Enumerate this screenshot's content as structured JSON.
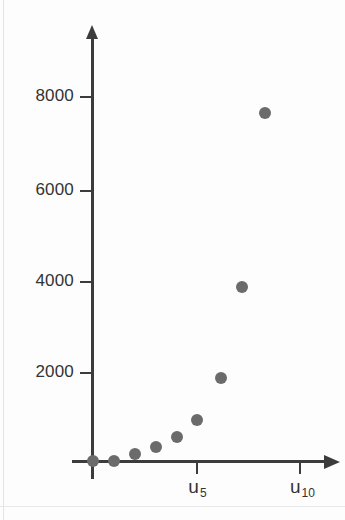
{
  "chart_data": {
    "type": "scatter",
    "title": "",
    "subtitle": "",
    "xlabel": "",
    "ylabel": "",
    "x_tick_labels": [
      "u5",
      "u10"
    ],
    "x_tick_label_html": [
      "u<sub>5</sub>",
      "u<sub>10</sub>"
    ],
    "x_tick_values": [
      5,
      10
    ],
    "y_tick_labels": [
      "8000",
      "6000",
      "4000",
      "2000"
    ],
    "y_tick_values": [
      8000,
      6000,
      4000,
      2000
    ],
    "xlim": [
      0,
      12
    ],
    "ylim": [
      0,
      9300
    ],
    "grid": false,
    "legend": null,
    "axes_style": "arrow-axes",
    "marker": "filled-circle",
    "marker_color": "#6b6b6b",
    "axis_color": "#3c3c3c",
    "x": [
      1,
      2,
      3,
      4,
      5,
      6,
      7,
      8,
      9,
      10
    ],
    "x_categories": [
      "u1",
      "u2",
      "u3",
      "u4",
      "u5",
      "u6",
      "u7",
      "u8",
      "u9",
      "u10"
    ],
    "values": [
      0,
      30,
      180,
      330,
      530,
      900,
      1820,
      3830,
      7620,
      null
    ],
    "series": [
      {
        "name": "series-1",
        "points": [
          {
            "label": "u1",
            "x": 1,
            "y": 0
          },
          {
            "label": "u2",
            "x": 2,
            "y": 30
          },
          {
            "label": "u3",
            "x": 3,
            "y": 180
          },
          {
            "label": "u4",
            "x": 4,
            "y": 330
          },
          {
            "label": "u5",
            "x": 5,
            "y": 530
          },
          {
            "label": "u6",
            "x": 6,
            "y": 900
          },
          {
            "label": "u7",
            "x": 7,
            "y": 1820
          },
          {
            "label": "u8",
            "x": 8,
            "y": 3830
          },
          {
            "label": "u9",
            "x": 9,
            "y": 7620
          }
        ]
      }
    ],
    "origin_marker": {
      "label": "origin",
      "x": 0,
      "y": 0
    }
  },
  "geometry": {
    "origin_px": {
      "x": 93,
      "y": 461
    },
    "px_per_x_unit": 20.6,
    "px_per_y_unit": 0.0458,
    "y_ticks_px": [
      96,
      190,
      281,
      372
    ],
    "x_ticks_px": [
      197,
      300
    ],
    "point_px": [
      {
        "x": 93,
        "y": 461
      },
      {
        "x": 114,
        "y": 461
      },
      {
        "x": 135,
        "y": 454
      },
      {
        "x": 156,
        "y": 447
      },
      {
        "x": 177,
        "y": 437
      },
      {
        "x": 197,
        "y": 420
      },
      {
        "x": 221,
        "y": 378
      },
      {
        "x": 242,
        "y": 287
      },
      {
        "x": 265,
        "y": 113
      }
    ]
  }
}
